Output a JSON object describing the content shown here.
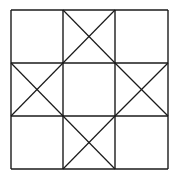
{
  "diagram": {
    "stroke_color": "#1a1a1a",
    "background": "#ffffff",
    "grid_x": [
      11,
      63,
      115,
      168
    ],
    "grid_y": [
      10,
      63,
      116,
      169
    ],
    "cells_with_x": [
      "top-middle",
      "middle-left",
      "middle-right",
      "bottom-middle"
    ],
    "empty_cells": [
      "top-left",
      "top-right",
      "center",
      "bottom-left",
      "bottom-right"
    ]
  }
}
